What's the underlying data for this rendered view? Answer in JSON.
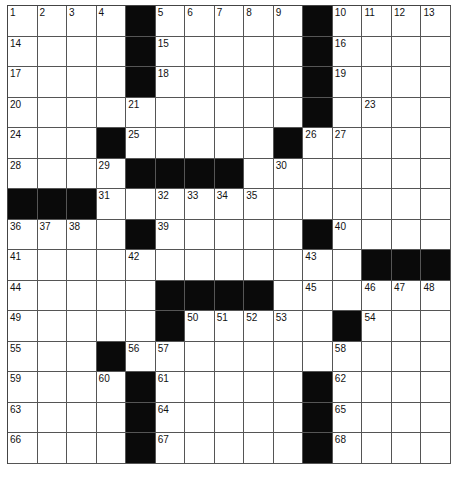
{
  "puzzle": {
    "rows": 15,
    "cols": 15,
    "colors": {
      "block": "#0a0a0a",
      "cell": "#ffffff",
      "line": "#555555"
    },
    "layout": [
      ".... ..... ....",
      ".... ..... ....",
      ".... ..... ....",
      ".......... ....",
      "... ..... .....",
      "....    .......",
      "   ............",
      ".... ..... ....",
      "............   ",
      ".....    ......",
      "..... ..... ...",
      "... ...........",
      ".... ..... ....",
      ".... ..... ....",
      ".... ..... ...."
    ],
    "numbers": {
      "0,0": "1",
      "0,1": "2",
      "0,2": "3",
      "0,3": "4",
      "0,5": "5",
      "0,6": "6",
      "0,7": "7",
      "0,8": "8",
      "0,9": "9",
      "0,11": "10",
      "0,12": "11",
      "0,13": "12",
      "0,14": "13",
      "1,0": "14",
      "1,5": "15",
      "1,11": "16",
      "2,0": "17",
      "2,5": "18",
      "2,11": "19",
      "3,0": "20",
      "3,4": "21",
      "3,10": "22",
      "3,12": "23",
      "4,0": "24",
      "4,4": "25",
      "4,10": "26",
      "4,11": "27",
      "5,0": "28",
      "5,3": "29",
      "5,9": "30",
      "6,3": "31",
      "6,5": "32",
      "6,6": "33",
      "6,7": "34",
      "6,8": "35",
      "7,0": "36",
      "7,1": "37",
      "7,2": "38",
      "7,5": "39",
      "7,11": "40",
      "8,0": "41",
      "8,4": "42",
      "8,10": "43",
      "9,0": "44",
      "9,10": "45",
      "9,12": "46",
      "9,13": "47",
      "9,14": "48",
      "10,0": "49",
      "10,6": "50",
      "10,7": "51",
      "10,8": "52",
      "10,9": "53",
      "10,12": "54",
      "11,0": "55",
      "11,4": "56",
      "11,5": "57",
      "11,11": "58",
      "12,0": "59",
      "12,3": "60",
      "12,5": "61",
      "12,11": "62",
      "13,0": "63",
      "13,5": "64",
      "13,11": "65",
      "14,0": "66",
      "14,5": "67",
      "14,11": "68"
    },
    "letters": {}
  }
}
